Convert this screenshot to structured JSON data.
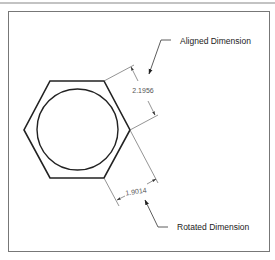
{
  "diagram": {
    "callouts": {
      "aligned": "Aligned Dimension",
      "rotated": "Rotated Dimension"
    },
    "dimensions": {
      "aligned_value": "2.1956",
      "rotated_value": "1.9014"
    },
    "shapes": {
      "outer": "hexagon",
      "inner": "circle"
    }
  }
}
